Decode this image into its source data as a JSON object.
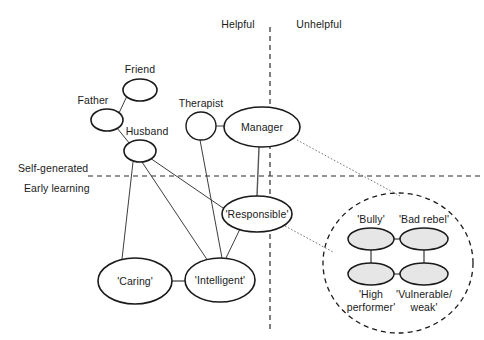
{
  "diagram": {
    "axes": {
      "vertical_divider": {
        "left_label": "Helpful",
        "right_label": "Unhelpful",
        "x": 270
      },
      "horizontal_divider": {
        "above_label": "Self-generated",
        "below_label": "Early learning",
        "y": 176
      }
    },
    "nodes": [
      {
        "id": "friend",
        "label": "Friend",
        "cx": 140,
        "cy": 90,
        "rx": 17,
        "ry": 11,
        "fill": "none",
        "label_pos": "above",
        "label_x": 140,
        "label_y": 63
      },
      {
        "id": "father",
        "label": "Father",
        "cx": 107,
        "cy": 120,
        "rx": 16,
        "ry": 11,
        "fill": "none",
        "label_pos": "above-left",
        "label_x": 93,
        "label_y": 93
      },
      {
        "id": "husband",
        "label": "Husband",
        "cx": 140,
        "cy": 151,
        "rx": 16,
        "ry": 11,
        "fill": "none",
        "label_pos": "above-right",
        "label_x": 146,
        "label_y": 125
      },
      {
        "id": "therapist",
        "label": "Therapist",
        "cx": 201,
        "cy": 126,
        "rx": 15,
        "ry": 14,
        "fill": "none",
        "label_pos": "above",
        "label_x": 200,
        "label_y": 97
      },
      {
        "id": "manager",
        "label": "Manager",
        "cx": 262,
        "cy": 127,
        "rx": 38,
        "ry": 20,
        "fill": "none",
        "label_pos": "inside",
        "label_x": 262,
        "label_y": 121
      },
      {
        "id": "responsible",
        "label": "'Responsible'",
        "cx": 257,
        "cy": 214,
        "rx": 35,
        "ry": 18,
        "fill": "none",
        "label_pos": "inside",
        "label_x": 257,
        "label_y": 208
      },
      {
        "id": "caring",
        "label": "'Caring'",
        "cx": 135,
        "cy": 281,
        "rx": 37,
        "ry": 23,
        "fill": "none",
        "label_pos": "inside",
        "label_x": 135,
        "label_y": 275
      },
      {
        "id": "intelligent",
        "label": "'Intelligent'",
        "cx": 220,
        "cy": 280,
        "rx": 35,
        "ry": 22,
        "fill": "none",
        "label_pos": "inside",
        "label_x": 220,
        "label_y": 274
      },
      {
        "id": "bully",
        "label": "'Bully'",
        "cx": 371,
        "cy": 239,
        "rx": 23,
        "ry": 11,
        "fill": "gray",
        "label_pos": "above",
        "label_x": 371,
        "label_y": 213
      },
      {
        "id": "bad_rebel",
        "label": "'Bad rebel'",
        "cx": 424,
        "cy": 239,
        "rx": 24,
        "ry": 11,
        "fill": "gray",
        "label_pos": "above",
        "label_x": 424,
        "label_y": 213
      },
      {
        "id": "high_perf",
        "label": "'High\nperformer'",
        "cx": 371,
        "cy": 274,
        "rx": 23,
        "ry": 11,
        "fill": "gray",
        "label_pos": "below",
        "label_x": 371,
        "label_y": 288
      },
      {
        "id": "vulnerable",
        "label": "'Vulnerable/\nweak'",
        "cx": 424,
        "cy": 274,
        "rx": 24,
        "ry": 11,
        "fill": "gray",
        "label_pos": "below",
        "label_x": 424,
        "label_y": 288
      }
    ],
    "node_labels": {
      "friend": "Friend",
      "father": "Father",
      "husband": "Husband",
      "therapist": "Therapist",
      "manager": "Manager",
      "responsible": "'Responsible'",
      "caring": "'Caring'",
      "intelligent": "'Intelligent'",
      "bully": "'Bully'",
      "bad_rebel": "'Bad rebel'",
      "high_perf_line1": "'High",
      "high_perf_line2": "performer'",
      "vulnerable_line1": "'Vulnerable/",
      "vulnerable_line2": "weak'"
    },
    "links": [
      {
        "from": "father",
        "to": "friend",
        "style": "solid"
      },
      {
        "from": "father",
        "to": "husband",
        "style": "solid"
      },
      {
        "from": "husband",
        "to": "caring",
        "style": "solid"
      },
      {
        "from": "husband",
        "to": "intelligent",
        "style": "solid"
      },
      {
        "from": "husband",
        "to": "responsible",
        "style": "solid"
      },
      {
        "from": "therapist",
        "to": "manager",
        "style": "solid"
      },
      {
        "from": "therapist",
        "to": "intelligent",
        "style": "solid"
      },
      {
        "from": "manager",
        "to": "responsible",
        "style": "solid"
      },
      {
        "from": "responsible",
        "to": "intelligent",
        "style": "solid"
      },
      {
        "from": "caring",
        "to": "intelligent",
        "style": "solid"
      },
      {
        "from": "manager",
        "to": "group_circle",
        "style": "dotted"
      },
      {
        "from": "responsible",
        "to": "group_circle",
        "style": "dotted"
      },
      {
        "from": "bully",
        "to": "bad_rebel",
        "style": "solid"
      },
      {
        "from": "bully",
        "to": "high_perf",
        "style": "solid"
      },
      {
        "from": "bad_rebel",
        "to": "vulnerable",
        "style": "solid"
      },
      {
        "from": "high_perf",
        "to": "vulnerable",
        "style": "solid"
      }
    ],
    "group_circle": {
      "cx": 398,
      "cy": 263,
      "rx": 75,
      "ry": 70
    },
    "colors": {
      "stroke": "#1a1a1a",
      "node_fill": "#ffffff",
      "group_node_fill": "#e6e6e6",
      "link": "#3d3d3d",
      "background": "#ffffff"
    }
  }
}
